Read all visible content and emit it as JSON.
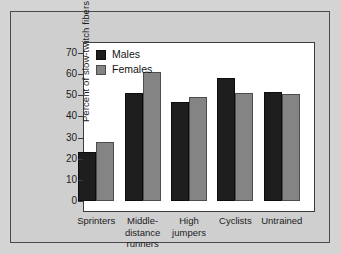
{
  "chart_data": {
    "type": "bar",
    "title": "",
    "xlabel": "",
    "ylabel": "Percent of slow-twitch fibers",
    "ylim": [
      0,
      75
    ],
    "yticks": [
      0,
      10,
      20,
      30,
      40,
      50,
      60,
      70
    ],
    "grid": false,
    "legend_position": "top-left",
    "categories": [
      "Sprinters",
      "Middle-distance runners",
      "High jumpers",
      "Cyclists",
      "Untrained"
    ],
    "category_lines": [
      [
        "Sprinters"
      ],
      [
        "Middle-",
        "distance",
        "runners"
      ],
      [
        "High",
        "jumpers"
      ],
      [
        "Cyclists"
      ],
      [
        "Untrained"
      ]
    ],
    "series": [
      {
        "name": "Males",
        "color": "#1e1e1e",
        "values": [
          23,
          51,
          47,
          58,
          51.5
        ]
      },
      {
        "name": "Females",
        "color": "#848484",
        "values": [
          28,
          61,
          49,
          51,
          50.5
        ]
      }
    ]
  },
  "colors": {
    "figure_background": "#d4d4d4",
    "panel_background": "#cfcfcf",
    "plot_background": "#ffffff",
    "axis": "#3c3c3c",
    "males": "#1e1e1e",
    "females": "#848484"
  }
}
